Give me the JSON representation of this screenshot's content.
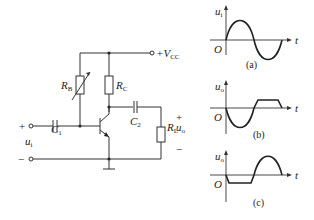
{
  "circuit": {
    "supply_label": "+V",
    "supply_sub": "CC",
    "rb_label": "R",
    "rb_sub": "B",
    "rc_label": "R",
    "rc_sub": "C",
    "c1_label": "C",
    "c1_sub": "1",
    "c2_label": "C",
    "c2_sub": "2",
    "rl_label": "R",
    "rl_sub": "L",
    "uo_label": "u",
    "uo_sub": "o",
    "ui_label": "u",
    "ui_sub": "i",
    "input_plus": "+",
    "input_minus": "−",
    "output_plus": "+",
    "output_minus": "−"
  },
  "waveforms": [
    {
      "id": "a",
      "ylabel": "u",
      "ysub": "i",
      "xlabel": "t",
      "origin": "O",
      "caption": "(a)",
      "shape": "sine"
    },
    {
      "id": "b",
      "ylabel": "u",
      "ysub": "o",
      "xlabel": "t",
      "origin": "O",
      "caption": "(b)",
      "shape": "negative-half-then-clipped-positive"
    },
    {
      "id": "c",
      "ylabel": "u",
      "ysub": "o",
      "xlabel": "t",
      "origin": "O",
      "caption": "(c)",
      "shape": "clipped-negative-then-positive-half"
    }
  ]
}
